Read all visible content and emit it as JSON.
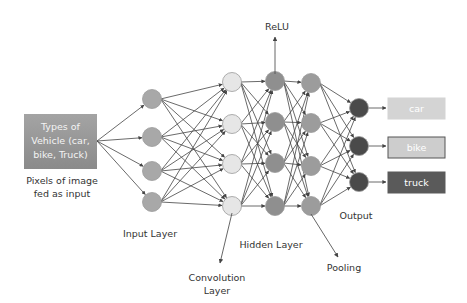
{
  "input_box": {
    "lines": [
      "Types of",
      "Vehicle (car,",
      "bike, Truck)"
    ],
    "caption_lines": [
      "Pixels of image",
      "fed as input"
    ]
  },
  "layers": [
    {
      "id": "input",
      "label_lines": [
        "Input Layer"
      ],
      "node_count": 4,
      "color": "#a8a8a8"
    },
    {
      "id": "convolution",
      "label_lines": [
        "Convolution",
        "Layer"
      ],
      "node_count": 4,
      "color": "#e6e6e6"
    },
    {
      "id": "hidden1",
      "label_lines": [
        "Hidden Layer"
      ],
      "node_count": 4,
      "color": "#8f8f8f"
    },
    {
      "id": "hidden2",
      "label_lines": [
        "Pooling"
      ],
      "node_count": 4,
      "color": "#9c9c9c"
    },
    {
      "id": "output",
      "label_lines": [
        "Output"
      ],
      "node_count": 3,
      "color": "#4a4a4a"
    }
  ],
  "annotations": {
    "relu": "ReLU",
    "input_layer": "Input Layer",
    "convolution_layer": [
      "Convolution",
      "Layer"
    ],
    "hidden_layer": "Hidden Layer",
    "pooling": "Pooling",
    "output": "Output"
  },
  "outputs": [
    {
      "label": "car",
      "fill": "#d4d4d4",
      "stroke": "#d4d4d4"
    },
    {
      "label": "bike",
      "fill": "#cdcdcd",
      "stroke": "#555555"
    },
    {
      "label": "truck",
      "fill": "#5a5a5a",
      "stroke": "#5a5a5a"
    }
  ],
  "colors": {
    "edge": "#444444",
    "node_stroke": "#9a9a9a",
    "input_box_top": "#a2a2a2",
    "input_box_bottom": "#8a8a8a"
  }
}
